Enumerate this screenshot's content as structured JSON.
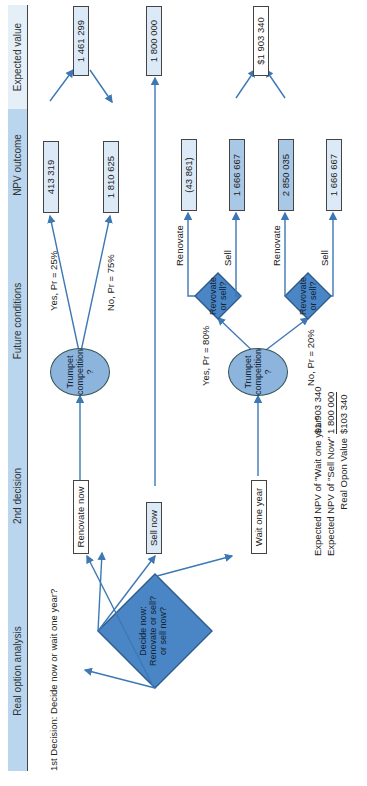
{
  "headers": [
    "Real option analysis",
    "2nd decision",
    "Future conditions",
    "NPV outcome",
    "Expected value"
  ],
  "first_decision_label": "1st Decision: Decide now or wait one year?",
  "root_diamond": "Decide now:\nRenovate or sell?\nor sell now?",
  "second_decisions": [
    "Renovate now",
    "Sell now",
    "Wait one year"
  ],
  "chance_node": "Trumpet\ncompetition\n?",
  "renovate_now": {
    "yes": "Yes, Pr = 25%",
    "no": "No, Pr = 75%",
    "npv_yes": "413 319",
    "npv_no": "1 810 625",
    "ev": "1 461 299"
  },
  "sell_now": {
    "ev": "1 800 000"
  },
  "wait": {
    "yes": "Yes, Pr = 80%",
    "no": "No, Pr = 20%",
    "diamond": "Revovate\nor sell?",
    "renovate": "Renovate",
    "sell": "Sell",
    "yes_renovate": "(43 861)",
    "yes_sell": "1 666 667",
    "no_renovate": "2 850 035",
    "no_sell": "1 666 667",
    "ev": "$1 903 340"
  },
  "summary": {
    "rows": [
      {
        "label": "Expected NPV of \"Wait one year\"",
        "value": "$1 903 340"
      },
      {
        "label": "Expected NPV of \"Sell Now\"",
        "value": "1 800 000"
      },
      {
        "label": "Real Opon Value",
        "value": "$103 340"
      }
    ]
  },
  "colors": {
    "header": "#b9d6ee",
    "diamond": "#4a86c5",
    "oval": "#8db4dc",
    "arrow": "#3d78b5"
  }
}
